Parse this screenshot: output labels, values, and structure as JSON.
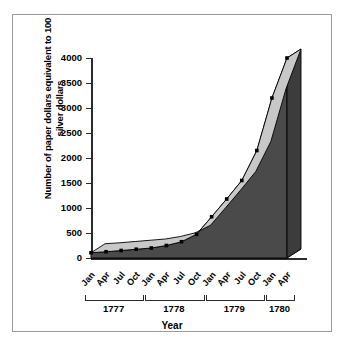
{
  "chart_data": {
    "type": "area",
    "title": "",
    "xlabel": "Year",
    "ylabel": "Number of paper dollars equivalent to 100 silver dollars",
    "ylim": [
      0,
      4000
    ],
    "yticks": [
      0,
      500,
      1000,
      1500,
      2000,
      2500,
      3000,
      3500,
      4000
    ],
    "ytick_labels": [
      "0",
      "500",
      "1000",
      "1500",
      "2000",
      "2500",
      "3000",
      "3500",
      "4000"
    ],
    "grid": false,
    "legend": "none",
    "three_d": true,
    "categories": [
      "Jan",
      "Apr",
      "Jul",
      "Oct",
      "Jan",
      "Apr",
      "Jul",
      "Oct",
      "Jan",
      "Apr",
      "Jul",
      "Oct",
      "Jan",
      "Apr"
    ],
    "values": [
      105,
      125,
      150,
      175,
      200,
      250,
      325,
      475,
      825,
      1180,
      1550,
      2150,
      3200,
      4000
    ],
    "groups": [
      {
        "label": "1777",
        "start": 0,
        "end": 3
      },
      {
        "label": "1778",
        "start": 4,
        "end": 7
      },
      {
        "label": "1779",
        "start": 8,
        "end": 11
      },
      {
        "label": "1780",
        "start": 12,
        "end": 13
      }
    ],
    "colors": {
      "top_face": "#c8c8c8",
      "front_face": "#4a4a4a",
      "outline": "#000000",
      "marker": "#000000",
      "axis": "#2b2b2b",
      "frame": "#9a9a9a",
      "background": "#ffffff"
    }
  },
  "axis": {
    "y_title": "Number of paper dollars equivalent to 100 silver dollars",
    "x_title": "Year"
  }
}
